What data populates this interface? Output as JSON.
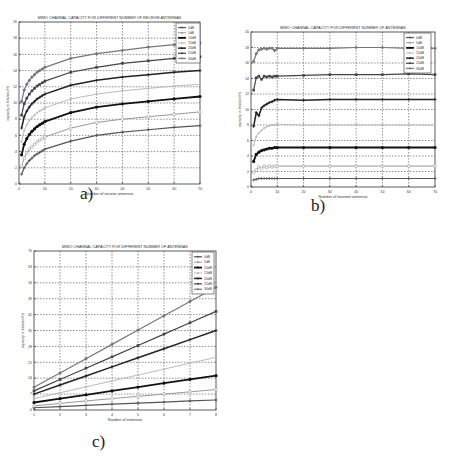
{
  "chart_data": [
    {
      "id": "a",
      "type": "line",
      "title": "MIMO CHANNAL CAPACITY FOR DIFFERENT NUMBER OF RECEIVE ANTENNAS",
      "xlabel": "Number of receive antennas",
      "ylabel": "capacity in bits/sec/Hz",
      "xlim": [
        0,
        70
      ],
      "ylim": [
        0,
        20
      ],
      "xticks": [
        0,
        10,
        20,
        30,
        40,
        50,
        60,
        70
      ],
      "yticks": [
        0,
        2,
        4,
        6,
        8,
        10,
        12,
        14,
        16,
        18,
        20
      ],
      "grid": true,
      "legend_position": "top-right",
      "x": [
        1,
        2,
        3,
        4,
        5,
        6,
        7,
        8,
        9,
        10,
        20,
        30,
        40,
        50,
        60,
        70
      ],
      "series": [
        {
          "name": "0dB",
          "values": [
            1.2,
            2.0,
            2.5,
            2.9,
            3.2,
            3.5,
            3.7,
            3.9,
            4.1,
            4.3,
            5.3,
            6.0,
            6.4,
            6.7,
            7.0,
            7.2
          ]
        },
        {
          "name": "5dB",
          "values": [
            2.2,
            3.2,
            3.8,
            4.3,
            4.6,
            4.9,
            5.2,
            5.4,
            5.6,
            5.8,
            6.9,
            7.6,
            8.0,
            8.3,
            8.6,
            8.9
          ]
        },
        {
          "name": "10dB",
          "values": [
            3.6,
            4.9,
            5.6,
            6.1,
            6.5,
            6.8,
            7.1,
            7.3,
            7.5,
            7.7,
            8.8,
            9.5,
            9.9,
            10.2,
            10.5,
            10.8
          ]
        },
        {
          "name": "15dB",
          "values": [
            5.2,
            6.6,
            7.3,
            7.8,
            8.2,
            8.5,
            8.8,
            9.0,
            9.2,
            9.4,
            10.5,
            11.1,
            11.5,
            11.8,
            12.1,
            12.3
          ]
        },
        {
          "name": "20dB",
          "values": [
            6.9,
            8.3,
            9.0,
            9.5,
            9.9,
            10.2,
            10.5,
            10.7,
            10.9,
            11.1,
            12.2,
            12.8,
            13.2,
            13.5,
            13.8,
            14.0
          ]
        },
        {
          "name": "25dB",
          "values": [
            8.5,
            9.9,
            10.6,
            11.1,
            11.5,
            11.8,
            12.1,
            12.3,
            12.5,
            12.7,
            13.8,
            14.4,
            14.9,
            15.2,
            15.5,
            15.7
          ]
        },
        {
          "name": "30dB",
          "values": [
            10.2,
            11.6,
            12.3,
            12.8,
            13.2,
            13.5,
            13.8,
            14.0,
            14.2,
            14.4,
            15.5,
            16.1,
            16.5,
            16.9,
            17.2,
            17.4
          ]
        }
      ]
    },
    {
      "id": "b",
      "type": "line",
      "title": "MIMO CHANNAL CAPACITY FOR DIFFERENT NUMBER OF ANTENNAS",
      "xlabel": "Number of transmit antennas",
      "ylabel": "capacity in bits/sec/Hz",
      "xlim": [
        0,
        70
      ],
      "ylim": [
        0,
        20
      ],
      "xticks": [
        0,
        10,
        20,
        30,
        40,
        50,
        60,
        70
      ],
      "yticks": [
        0,
        2,
        4,
        6,
        8,
        10,
        12,
        14,
        16,
        18,
        20
      ],
      "grid": true,
      "legend_position": "top-right",
      "x": [
        1,
        2,
        3,
        4,
        5,
        6,
        7,
        8,
        9,
        10,
        20,
        30,
        40,
        50,
        60,
        70
      ],
      "series": [
        {
          "name": "0dB",
          "values": [
            0.9,
            1.0,
            1.1,
            1.1,
            1.1,
            1.1,
            1.1,
            1.1,
            1.1,
            1.1,
            1.1,
            1.1,
            1.1,
            1.1,
            1.1,
            1.1
          ]
        },
        {
          "name": "5dB",
          "values": [
            1.9,
            2.2,
            2.6,
            2.4,
            2.7,
            2.5,
            2.7,
            2.6,
            2.7,
            2.7,
            2.7,
            2.7,
            2.7,
            2.7,
            2.7,
            2.7
          ]
        },
        {
          "name": "10dB",
          "values": [
            3.3,
            4.2,
            4.5,
            4.7,
            4.8,
            4.9,
            5.0,
            5.0,
            5.1,
            5.1,
            5.1,
            5.1,
            5.1,
            5.1,
            5.1,
            5.1
          ]
        },
        {
          "name": "15dB",
          "values": [
            5.4,
            6.5,
            7.0,
            7.3,
            7.6,
            7.8,
            7.9,
            8.0,
            8.0,
            8.1,
            8.0,
            8.0,
            8.0,
            8.0,
            8.0,
            8.0
          ]
        },
        {
          "name": "20dB",
          "values": [
            7.8,
            9.6,
            9.2,
            10.2,
            10.5,
            10.7,
            10.9,
            11.0,
            11.2,
            11.3,
            11.2,
            11.3,
            11.3,
            11.3,
            11.3,
            11.3
          ]
        },
        {
          "name": "25dB",
          "values": [
            12.5,
            14.1,
            14.3,
            13.9,
            14.3,
            14.2,
            14.3,
            14.2,
            14.3,
            14.3,
            14.4,
            14.5,
            14.5,
            14.5,
            14.6,
            14.5
          ]
        },
        {
          "name": "30dB",
          "values": [
            16.2,
            17.2,
            17.7,
            17.8,
            17.9,
            17.8,
            17.9,
            17.9,
            17.6,
            17.9,
            17.9,
            17.9,
            18.0,
            18.0,
            17.9,
            17.9
          ]
        }
      ]
    },
    {
      "id": "c",
      "type": "line",
      "title": "MIMO CHANNAL CAPACITY FOR DIFFERENT NUMBER OF ANTENNAS",
      "xlabel": "Number of antennas",
      "ylabel": "capacity in bits/sec/Hz",
      "xlim": [
        1,
        8
      ],
      "ylim": [
        0,
        70
      ],
      "xticks": [
        1,
        2,
        3,
        4,
        5,
        6,
        7,
        8
      ],
      "yticks": [
        0,
        5,
        10,
        15,
        20,
        25,
        30,
        35,
        40,
        45,
        50,
        55,
        60,
        65,
        70
      ],
      "grid": true,
      "legend_position": "top-right",
      "x": [
        1,
        2,
        3,
        4,
        5,
        6,
        7,
        8
      ],
      "series": [
        {
          "name": "0dB",
          "values": [
            1.0,
            1.5,
            2.0,
            2.6,
            3.0,
            3.5,
            4.0,
            4.4
          ]
        },
        {
          "name": "5dB",
          "values": [
            1.8,
            2.9,
            4.0,
            5.0,
            6.0,
            7.0,
            8.0,
            9.0
          ]
        },
        {
          "name": "10dB",
          "values": [
            3.3,
            5.0,
            6.7,
            8.4,
            10.1,
            11.8,
            13.5,
            15.1
          ]
        },
        {
          "name": "15dB",
          "values": [
            5.0,
            7.6,
            10.2,
            12.8,
            15.4,
            18.0,
            20.6,
            23.2
          ]
        },
        {
          "name": "20dB",
          "values": [
            7.0,
            11.0,
            15.0,
            19.0,
            23.0,
            27.0,
            31.0,
            35.0
          ]
        },
        {
          "name": "25dB",
          "values": [
            8.4,
            13.4,
            18.4,
            23.4,
            28.4,
            33.4,
            38.4,
            43.4
          ]
        },
        {
          "name": "30dB",
          "values": [
            10.0,
            16.3,
            22.6,
            28.9,
            35.2,
            41.5,
            47.8,
            54.0
          ]
        }
      ]
    }
  ],
  "captions": {
    "a": "a)",
    "b": "b)",
    "c": "c)"
  },
  "series_style": [
    {
      "color": "#555555",
      "width": 1.2,
      "marker": "+"
    },
    {
      "color": "#999999",
      "width": 1.0,
      "marker": "o"
    },
    {
      "color": "#111111",
      "width": 1.8,
      "marker": "*"
    },
    {
      "color": "#bbbbbb",
      "width": 1.0,
      "marker": "."
    },
    {
      "color": "#222222",
      "width": 1.5,
      "marker": "x"
    },
    {
      "color": "#444444",
      "width": 1.2,
      "marker": "s"
    },
    {
      "color": "#777777",
      "width": 1.2,
      "marker": "d"
    }
  ]
}
